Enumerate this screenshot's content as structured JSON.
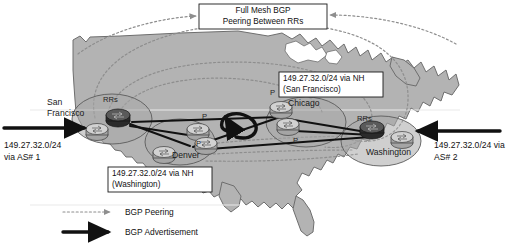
{
  "figure": {
    "colors": {
      "land": "#b3b3b3",
      "land_outline": "#6e6e6e",
      "peering": "#8e8e8e",
      "advertisement": "#111111",
      "callout_fill": "#ffffff",
      "callout_border": "#1a1a1a"
    }
  },
  "callouts": {
    "full_mesh": {
      "line1": "Full Mesh BGP",
      "line2": "Peering Between RRs"
    },
    "chicago_nh": {
      "line1": "149.27.32.0/24 via NH",
      "line2": "(San Francisco)"
    },
    "denver_nh": {
      "line1": "149.27.32.0/24 via NH",
      "line2": "(Washington)"
    }
  },
  "sites": [
    {
      "id": "san-francisco",
      "name_line1": "San",
      "name_line2": "Francisco",
      "rr_label": "RRs",
      "node_labels": []
    },
    {
      "id": "denver",
      "name_line1": "Denver",
      "name_line2": "",
      "rr_label": "",
      "node_labels": [
        "P",
        "P"
      ]
    },
    {
      "id": "chicago",
      "name_line1": "Chicago",
      "name_line2": "",
      "rr_label": "",
      "node_labels": [
        "P",
        "P"
      ]
    },
    {
      "id": "washington",
      "name_line1": "Washington",
      "name_line2": "",
      "rr_label": "RRs",
      "node_labels": []
    }
  ],
  "edge_advertisements": {
    "left": {
      "line1": "149.27.32.0/24",
      "line2": "via AS# 1"
    },
    "right": {
      "line1": "149.27.32.0/24 via",
      "line2": "AS# 2"
    }
  },
  "legend": {
    "items": [
      {
        "label": "BGP Peering",
        "style": "dotted-gray-arrow"
      },
      {
        "label": "BGP Advertisement",
        "style": "solid-black-arrow"
      }
    ]
  },
  "node_tags": {
    "rrs": "RRs",
    "p": "P"
  }
}
